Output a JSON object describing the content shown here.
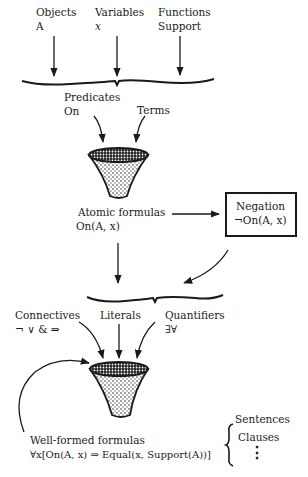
{
  "inputs": [
    {
      "label": "Objects",
      "example": "A"
    },
    {
      "label": "Variables",
      "example": "x"
    },
    {
      "label": "Functions",
      "example": "Support"
    }
  ],
  "stage1": {
    "predicates_label": "Predicates",
    "predicates_example": "On",
    "terms_label": "Terms"
  },
  "atomic": {
    "label": "Atomic formulas",
    "example": "On(A, x)"
  },
  "negation": {
    "label": "Negation",
    "example": "¬On(A, x)"
  },
  "stage2": {
    "connectives_label": "Connectives",
    "connectives_symbols": "¬ ∨ & ⇒",
    "literals_label": "Literals",
    "quantifiers_label": "Quantifiers",
    "quantifiers_symbols": "∃∀"
  },
  "wff": {
    "label": "Well-formed formulas",
    "example": "∀x[On(A, x) ⇒ Equal(x, Support(A))]"
  },
  "outputs": {
    "items": [
      "Sentences",
      "Clauses"
    ],
    "ellipsis": "⋮"
  },
  "colors": {
    "ink": "#1a1a1a",
    "background": "#ffffff"
  }
}
